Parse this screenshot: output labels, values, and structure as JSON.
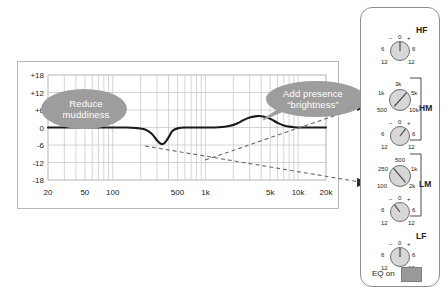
{
  "chart_data": {
    "type": "line",
    "title": "",
    "xlabel": "",
    "ylabel": "",
    "xscale": "log",
    "xlim": [
      20,
      20000
    ],
    "ylim": [
      -18,
      18
    ],
    "grid": true,
    "legend": "none",
    "x_ticks": [
      "20",
      "50",
      "100",
      "500",
      "1k",
      "5k",
      "10k",
      "20k"
    ],
    "x_tick_values": [
      20,
      50,
      100,
      500,
      1000,
      5000,
      10000,
      20000
    ],
    "y_ticks": [
      "+18",
      "+12",
      "+6",
      "0",
      "-6",
      "-12",
      "-18"
    ],
    "y_tick_values": [
      18,
      12,
      6,
      0,
      -6,
      -12,
      -18
    ],
    "series": [
      {
        "name": "EQ response",
        "x": [
          20,
          40,
          80,
          140,
          180,
          220,
          260,
          300,
          330,
          360,
          400,
          440,
          500,
          600,
          800,
          1000,
          1400,
          1800,
          2200,
          2600,
          3000,
          3600,
          4200,
          5000,
          6000,
          7000,
          8000,
          9000,
          11000,
          14000,
          20000
        ],
        "y": [
          0,
          0,
          0,
          0,
          -0.2,
          -0.6,
          -2.0,
          -4.4,
          -5.6,
          -5.4,
          -3.4,
          -1.2,
          -0.3,
          0,
          0,
          0,
          0.1,
          0.5,
          1.4,
          2.6,
          3.4,
          3.9,
          3.8,
          3.0,
          1.6,
          0.7,
          0.3,
          0.1,
          0,
          0,
          0
        ]
      }
    ],
    "annotations": [
      {
        "id": "reduce",
        "line1": "Reduce",
        "line2": "muddiness",
        "points_to": "dip-at-330hz"
      },
      {
        "id": "presence",
        "line1": "Add presence",
        "line2": "“brightness”",
        "points_to": "boost-at-4khz"
      }
    ]
  },
  "colors": {
    "curve": "#1a1a1a",
    "grid": "#c9c9c9",
    "frame": "#b9b9b9",
    "bubble_fill": "#9d9d9d",
    "bubble_text": "#ffffff",
    "panel_border": "#8d8d8d",
    "knob_fill": "#d7d7d7",
    "knob_stroke": "#6e6e6e",
    "eq_on_button": "#9a9a9a",
    "leader_line": "#6a6a6a",
    "text": "#1b1b1b"
  },
  "eq_strip": {
    "sections": [
      {
        "id": "hf",
        "label": "HF",
        "knobs": [
          {
            "id": "hf-gain",
            "type": "gain",
            "pointer_deg": 0,
            "scale_labels": {
              "minus": "−",
              "center": "0",
              "plus": "+",
              "left_mid": "6",
              "right_mid": "6",
              "left_end": "12",
              "right_end": "12"
            }
          }
        ]
      },
      {
        "id": "hm",
        "label": "HM",
        "knobs": [
          {
            "id": "hm-freq",
            "type": "frequency",
            "pointer_deg": 42,
            "scale_labels": {
              "top": "3k",
              "upper_left": "1k",
              "upper_right": "5k",
              "lower_left": "500",
              "lower_right": "10k"
            }
          },
          {
            "id": "hm-gain",
            "type": "gain",
            "pointer_deg": 38,
            "scale_labels": {
              "minus": "−",
              "center": "0",
              "plus": "+",
              "left_mid": "6",
              "right_mid": "6",
              "left_end": "12",
              "right_end": "12"
            }
          }
        ]
      },
      {
        "id": "lm",
        "label": "LM",
        "knobs": [
          {
            "id": "lm-freq",
            "type": "frequency",
            "pointer_deg": -40,
            "scale_labels": {
              "top": "500",
              "upper_left": "250",
              "upper_right": "1k",
              "lower_left": "100",
              "lower_right": "2k"
            }
          },
          {
            "id": "lm-gain",
            "type": "gain",
            "pointer_deg": -38,
            "scale_labels": {
              "minus": "−",
              "center": "0",
              "plus": "+",
              "left_mid": "6",
              "right_mid": "6",
              "left_end": "12",
              "right_end": "12"
            }
          }
        ]
      },
      {
        "id": "lf",
        "label": "LF",
        "knobs": [
          {
            "id": "lf-gain",
            "type": "gain",
            "pointer_deg": 0,
            "scale_labels": {
              "minus": "−",
              "center": "0",
              "plus": "+",
              "left_mid": "6",
              "right_mid": "6",
              "left_end": "12",
              "right_end": "12"
            }
          }
        ]
      }
    ],
    "eq_on": {
      "label": "EQ on",
      "state": "on"
    }
  }
}
